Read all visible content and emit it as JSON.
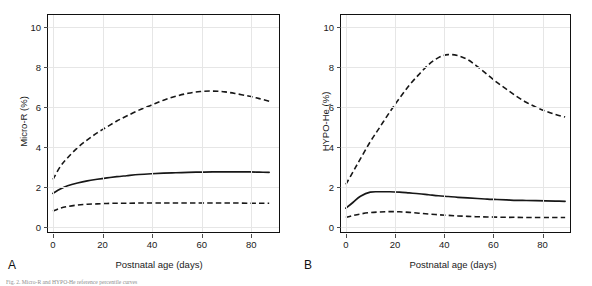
{
  "figure": {
    "caption_fragment": "Fig. 2. Micro-R and HYPO-He reference percentile curves"
  },
  "panels": [
    {
      "letter": "A",
      "ylabel": "Micro-R (%)",
      "xlabel": "Postnatal age (days)"
    },
    {
      "letter": "B",
      "ylabel": "HYPO-He (%)",
      "xlabel": "Postnatal age (days)"
    }
  ],
  "chart_data": [
    {
      "type": "line",
      "panel": "A",
      "title": "",
      "xlabel": "Postnatal age (days)",
      "ylabel": "Micro-R (%)",
      "xlim": [
        -2,
        92
      ],
      "ylim": [
        -0.35,
        10.6
      ],
      "xticks": [
        0,
        20,
        40,
        60,
        80
      ],
      "yticks": [
        0,
        2,
        4,
        6,
        8,
        10
      ],
      "grid": true,
      "legend": "none",
      "series": [
        {
          "name": "upper percentile",
          "style": "dashed",
          "x": [
            0,
            3,
            6,
            10,
            14,
            18,
            22,
            26,
            30,
            35,
            40,
            45,
            50,
            55,
            60,
            65,
            70,
            75,
            80,
            84,
            88
          ],
          "values": [
            2.3,
            2.95,
            3.4,
            3.9,
            4.3,
            4.65,
            4.95,
            5.25,
            5.5,
            5.8,
            6.05,
            6.3,
            6.5,
            6.65,
            6.74,
            6.76,
            6.72,
            6.62,
            6.5,
            6.38,
            6.25
          ]
        },
        {
          "name": "median",
          "style": "solid",
          "x": [
            0,
            3,
            6,
            10,
            14,
            18,
            22,
            26,
            30,
            35,
            40,
            45,
            50,
            55,
            60,
            65,
            70,
            75,
            80,
            84,
            88
          ],
          "values": [
            1.6,
            1.82,
            1.98,
            2.12,
            2.23,
            2.31,
            2.38,
            2.44,
            2.49,
            2.55,
            2.59,
            2.62,
            2.64,
            2.66,
            2.67,
            2.68,
            2.68,
            2.68,
            2.68,
            2.67,
            2.66
          ]
        },
        {
          "name": "lower percentile",
          "style": "dashed",
          "x": [
            0,
            3,
            6,
            10,
            14,
            18,
            22,
            26,
            30,
            35,
            40,
            45,
            50,
            55,
            60,
            65,
            70,
            75,
            80,
            84,
            88
          ],
          "values": [
            0.7,
            0.85,
            0.94,
            1.01,
            1.05,
            1.07,
            1.09,
            1.1,
            1.1,
            1.11,
            1.11,
            1.11,
            1.11,
            1.11,
            1.11,
            1.11,
            1.11,
            1.11,
            1.1,
            1.1,
            1.1
          ]
        }
      ]
    },
    {
      "type": "line",
      "panel": "B",
      "title": "",
      "xlabel": "Postnatal age (days)",
      "ylabel": "HYPO-He (%)",
      "xlim": [
        -2,
        92
      ],
      "ylim": [
        -0.35,
        10.6
      ],
      "xticks": [
        0,
        20,
        40,
        60,
        80
      ],
      "yticks": [
        0,
        2,
        4,
        6,
        8,
        10
      ],
      "grid": true,
      "legend": "none",
      "series": [
        {
          "name": "upper percentile",
          "style": "dashed",
          "x": [
            0,
            3,
            6,
            10,
            14,
            18,
            22,
            26,
            30,
            34,
            38,
            42,
            46,
            50,
            54,
            58,
            62,
            66,
            70,
            74,
            78,
            82,
            86,
            90
          ],
          "values": [
            2.05,
            2.7,
            3.35,
            4.2,
            4.95,
            5.7,
            6.4,
            7.05,
            7.6,
            8.1,
            8.45,
            8.6,
            8.55,
            8.35,
            8.0,
            7.6,
            7.2,
            6.85,
            6.5,
            6.2,
            5.95,
            5.75,
            5.58,
            5.45
          ]
        },
        {
          "name": "median",
          "style": "solid",
          "x": [
            0,
            3,
            6,
            10,
            14,
            18,
            22,
            26,
            30,
            34,
            38,
            42,
            46,
            50,
            54,
            58,
            62,
            66,
            70,
            74,
            78,
            82,
            86,
            90
          ],
          "values": [
            0.85,
            1.15,
            1.45,
            1.66,
            1.68,
            1.68,
            1.66,
            1.62,
            1.58,
            1.53,
            1.48,
            1.44,
            1.4,
            1.37,
            1.34,
            1.31,
            1.29,
            1.27,
            1.25,
            1.24,
            1.23,
            1.22,
            1.21,
            1.2
          ]
        },
        {
          "name": "lower percentile",
          "style": "dashed",
          "x": [
            0,
            3,
            6,
            10,
            14,
            18,
            22,
            26,
            30,
            34,
            38,
            42,
            46,
            50,
            54,
            58,
            62,
            66,
            70,
            74,
            78,
            82,
            86,
            90
          ],
          "values": [
            0.38,
            0.48,
            0.56,
            0.63,
            0.66,
            0.68,
            0.67,
            0.64,
            0.6,
            0.56,
            0.52,
            0.49,
            0.46,
            0.44,
            0.42,
            0.41,
            0.4,
            0.39,
            0.39,
            0.38,
            0.38,
            0.38,
            0.38,
            0.38
          ]
        }
      ]
    }
  ]
}
